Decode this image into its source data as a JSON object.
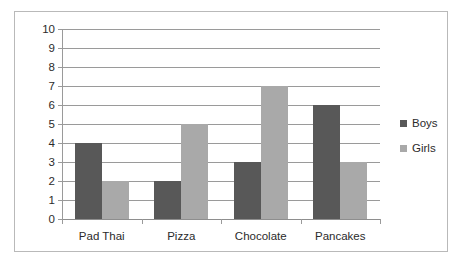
{
  "chart_data": {
    "type": "bar",
    "title": "",
    "xlabel": "",
    "ylabel": "",
    "categories": [
      "Pad Thai",
      "Pizza",
      "Chocolate",
      "Pancakes"
    ],
    "series": [
      {
        "name": "Boys",
        "values": [
          4,
          2,
          3,
          6
        ],
        "color": "#585858"
      },
      {
        "name": "Girls",
        "values": [
          2,
          5,
          7,
          3
        ],
        "color": "#a9a9a9"
      }
    ],
    "ylim": [
      0,
      10
    ],
    "ytick_step": 1,
    "yticks": [
      "10",
      "9",
      "8",
      "7",
      "6",
      "5",
      "4",
      "3",
      "2",
      "1",
      "0"
    ],
    "grid": true,
    "legend_position": "right",
    "legend_entries": [
      "Boys",
      "Girls"
    ]
  },
  "legend": {
    "items": [
      {
        "label": "Boys"
      },
      {
        "label": "Girls"
      }
    ]
  }
}
